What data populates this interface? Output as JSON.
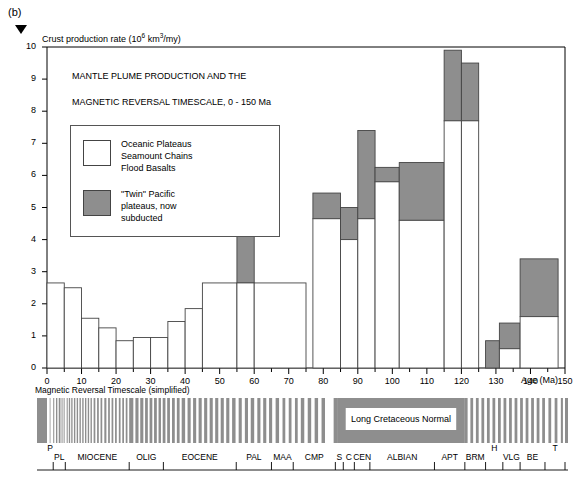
{
  "panel": {
    "label": "(b)"
  },
  "axis": {
    "y_title": "Crust production rate (10⁶ km³/my)",
    "y_title_parts": {
      "main": "Crust production rate (10",
      "sup": "6",
      "mid": " km",
      "sup2": "3",
      "end": "/my)"
    },
    "x_title": "Age (Ma)",
    "y_ticks": [
      "0",
      "1",
      "2",
      "3",
      "4",
      "5",
      "6",
      "7",
      "8",
      "9",
      "10"
    ],
    "x_ticks": [
      "0",
      "10",
      "20",
      "30",
      "40",
      "50",
      "60",
      "70",
      "80",
      "90",
      "100",
      "110",
      "120",
      "130",
      "140",
      "150"
    ],
    "x_minor_step": 5
  },
  "chart_title_line1": "MANTLE PLUME PRODUCTION AND THE",
  "chart_title_line2": "MAGNETIC REVERSAL TIMESCALE, 0 - 150 Ma",
  "legend": {
    "entry1": "Oceanic Plateaus\nSeamount Chains\nFlood Basalts",
    "entry2": "\"Twin\" Pacific\nplateaus, now\nsubducted",
    "swatch1_color": "#ffffff",
    "swatch2_color": "#8e8e8e"
  },
  "timescale": {
    "caption": "Magnetic Reversal Timescale (simplified)",
    "long_normal_label": "Long Cretaceous Normal",
    "normal_color": "#ffffff",
    "reversed_color": "#8e8e8e"
  },
  "stages": [
    {
      "label": "P",
      "start": 0,
      "end": 1.8,
      "raised": true
    },
    {
      "label": "PL",
      "start": 1.8,
      "end": 5.3,
      "raised": false
    },
    {
      "label": "MIOCENE",
      "start": 5.3,
      "end": 23.8,
      "raised": false
    },
    {
      "label": "OLIG",
      "start": 23.8,
      "end": 33.7,
      "raised": false
    },
    {
      "label": "EOCENE",
      "start": 33.7,
      "end": 54.8,
      "raised": false
    },
    {
      "label": "PAL",
      "start": 54.8,
      "end": 65.0,
      "raised": false
    },
    {
      "label": "MAA",
      "start": 65.0,
      "end": 71.3,
      "raised": false
    },
    {
      "label": "CMP",
      "start": 71.3,
      "end": 83.5,
      "raised": false
    },
    {
      "label": "S",
      "start": 83.5,
      "end": 85.8,
      "raised": false
    },
    {
      "label": "C",
      "start": 85.8,
      "end": 89.0,
      "raised": false
    },
    {
      "label": "CEN",
      "start": 89.0,
      "end": 93.5,
      "raised": false
    },
    {
      "label": "ALBIAN",
      "start": 93.5,
      "end": 112.2,
      "raised": false
    },
    {
      "label": "APT",
      "start": 112.2,
      "end": 121.0,
      "raised": false
    },
    {
      "label": "BRM",
      "start": 121.0,
      "end": 127.0,
      "raised": false
    },
    {
      "label": "H",
      "start": 127.0,
      "end": 132.0,
      "raised": true
    },
    {
      "label": "VLG",
      "start": 132.0,
      "end": 137.0,
      "raised": false
    },
    {
      "label": "BE",
      "start": 137.0,
      "end": 144.2,
      "raised": false
    },
    {
      "label": "T",
      "start": 144.2,
      "end": 150.0,
      "raised": true
    }
  ],
  "chart_data": {
    "type": "bar",
    "title": "MANTLE PLUME PRODUCTION AND THE MAGNETIC REVERSAL TIMESCALE, 0 - 150 Ma",
    "xlabel": "Age (Ma)",
    "ylabel": "Crust production rate (10^6 km^3/my)",
    "xlim": [
      0,
      150
    ],
    "ylim": [
      0,
      10
    ],
    "grid": false,
    "legend_position": "upper-left-inset",
    "bin_width": 5,
    "series": [
      {
        "name": "Oceanic Plateaus / Seamount Chains / Flood Basalts",
        "color": "#ffffff",
        "values": [
          2.65,
          2.65,
          2.5,
          1.55,
          1.25,
          0.85,
          0.95,
          0.95,
          1.05,
          1.45,
          1.45,
          1.85,
          2.65,
          2.65,
          2.65,
          2.65,
          2.65,
          2.65,
          2.65,
          2.65,
          2.65,
          2.65,
          2.65,
          2.65,
          4.65,
          4.65,
          4.0,
          4.0,
          4.65,
          4.65,
          5.8,
          5.8,
          4.6,
          4.6,
          4.6,
          7.7,
          7.7,
          0.0,
          0.0,
          0.6,
          0.6,
          1.6,
          1.6
        ]
      },
      {
        "name": "\"Twin\" Pacific plateaus, now subducted",
        "color": "#8e8e8e",
        "values": [
          0,
          0,
          0,
          0,
          0,
          0,
          0,
          0,
          0,
          0,
          0,
          0,
          4.2,
          0,
          0,
          0,
          0,
          0,
          0,
          0,
          0,
          0,
          0,
          0,
          5.45,
          5.45,
          5.0,
          5.0,
          7.4,
          7.4,
          6.25,
          6.25,
          6.4,
          6.4,
          6.4,
          9.9,
          9.5,
          0.85,
          0.85,
          1.4,
          1.4,
          3.4,
          3.4
        ]
      }
    ],
    "bins": [
      {
        "x0": 0,
        "x1": 5,
        "open_top": 2.65,
        "grey_top": 2.65
      },
      {
        "x0": 5,
        "x1": 10,
        "open_top": 2.5,
        "grey_top": 2.5
      },
      {
        "x0": 10,
        "x1": 15,
        "open_top": 1.55,
        "grey_top": 1.55
      },
      {
        "x0": 15,
        "x1": 20,
        "open_top": 1.25,
        "grey_top": 1.25
      },
      {
        "x0": 20,
        "x1": 25,
        "open_top": 0.85,
        "grey_top": 0.85
      },
      {
        "x0": 25,
        "x1": 30,
        "open_top": 0.95,
        "grey_top": 0.95
      },
      {
        "x0": 30,
        "x1": 35,
        "open_top": 0.95,
        "grey_top": 0.95
      },
      {
        "x0": 35,
        "x1": 40,
        "open_top": 1.45,
        "grey_top": 1.45
      },
      {
        "x0": 40,
        "x1": 45,
        "open_top": 1.85,
        "grey_top": 1.85
      },
      {
        "x0": 45,
        "x1": 55,
        "open_top": 2.65,
        "grey_top": 2.65
      },
      {
        "x0": 55,
        "x1": 60,
        "open_top": 2.65,
        "grey_top": 4.2
      },
      {
        "x0": 60,
        "x1": 75,
        "open_top": 2.65,
        "grey_top": 2.65
      },
      {
        "x0": 77,
        "x1": 85,
        "open_top": 4.65,
        "grey_top": 5.45
      },
      {
        "x0": 85,
        "x1": 90,
        "open_top": 4.0,
        "grey_top": 5.0
      },
      {
        "x0": 90,
        "x1": 95,
        "open_top": 4.65,
        "grey_top": 7.4
      },
      {
        "x0": 95,
        "x1": 102,
        "open_top": 5.8,
        "grey_top": 6.25
      },
      {
        "x0": 102,
        "x1": 115,
        "open_top": 4.6,
        "grey_top": 6.4
      },
      {
        "x0": 115,
        "x1": 120,
        "open_top": 7.7,
        "grey_top": 9.9
      },
      {
        "x0": 120,
        "x1": 125,
        "open_top": 7.7,
        "grey_top": 9.5
      },
      {
        "x0": 127,
        "x1": 131,
        "open_top": 0.0,
        "grey_top": 0.85
      },
      {
        "x0": 131,
        "x1": 137,
        "open_top": 0.6,
        "grey_top": 1.4
      },
      {
        "x0": 137,
        "x1": 148,
        "open_top": 1.6,
        "grey_top": 3.4
      }
    ]
  },
  "colors": {
    "grey_fill": "#8e8e8e",
    "stroke": "#444444",
    "axis": "#000000"
  }
}
